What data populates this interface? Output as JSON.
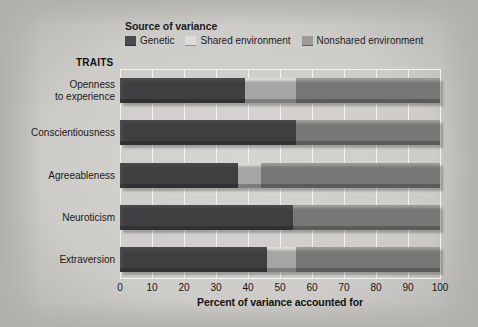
{
  "legend": {
    "title": "Source of variance",
    "items": [
      {
        "label": "Genetic",
        "color": "#4a4a4c",
        "icon": "legend-swatch-genetic"
      },
      {
        "label": "Shared environment",
        "color": "#dcdcd8",
        "icon": "legend-swatch-shared"
      },
      {
        "label": "Nonshared environment",
        "color": "#9a9a97",
        "icon": "legend-swatch-nonshared"
      }
    ]
  },
  "axes": {
    "traits_heading": "TRAITS",
    "xlabel": "Percent of variance accounted for",
    "ticks": [
      "0",
      "10",
      "20",
      "30",
      "40",
      "50",
      "60",
      "70",
      "80",
      "90",
      "100"
    ]
  },
  "chart_data": {
    "type": "bar",
    "orientation": "horizontal",
    "stacked": true,
    "title": "",
    "subtitle": "",
    "xlabel": "Percent of variance accounted for",
    "ylabel": "TRAITS",
    "xlim": [
      0,
      100
    ],
    "grid": true,
    "legend_title": "Source of variance",
    "legend_position": "top",
    "categories": [
      "Openness to experience",
      "Conscientiousness",
      "Agreeableness",
      "Neuroticism",
      "Extraversion"
    ],
    "series": [
      {
        "name": "Genetic",
        "color": "#4a4a4c",
        "values": [
          39,
          55,
          37,
          54,
          46
        ]
      },
      {
        "name": "Shared environment",
        "color": "#dcdcd8",
        "values": [
          16,
          0,
          7,
          0,
          9
        ]
      },
      {
        "name": "Nonshared environment",
        "color": "#9a9a97",
        "values": [
          45,
          45,
          56,
          46,
          45
        ]
      }
    ]
  },
  "rows": [
    {
      "label_line1": "Openness",
      "label_line2": "to experience"
    },
    {
      "label_line1": "Conscientiousness",
      "label_line2": ""
    },
    {
      "label_line1": "Agreeableness",
      "label_line2": ""
    },
    {
      "label_line1": "Neuroticism",
      "label_line2": ""
    },
    {
      "label_line1": "Extraversion",
      "label_line2": ""
    }
  ]
}
